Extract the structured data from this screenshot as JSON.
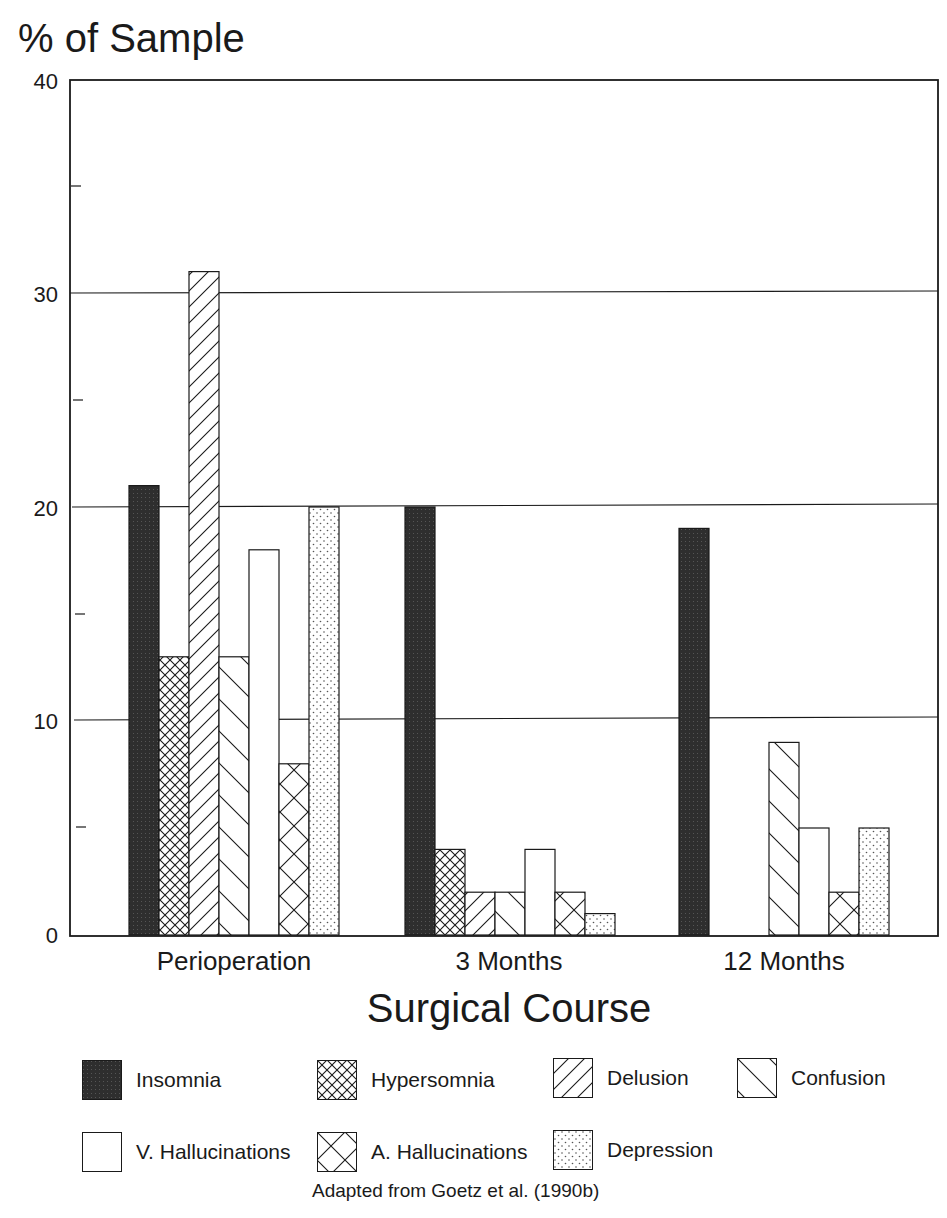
{
  "chart_data": {
    "type": "bar",
    "title": "",
    "ylabel": "% of Sample",
    "xlabel": "Surgical Course",
    "ylim": [
      0,
      40
    ],
    "yticks": [
      0,
      10,
      20,
      30,
      40
    ],
    "minor_yticks": [
      5,
      15,
      25,
      35
    ],
    "grid": true,
    "categories": [
      "Perioperation",
      "3 Months",
      "12 Months"
    ],
    "series": [
      {
        "name": "Insomnia",
        "pattern": "dark",
        "values": [
          21,
          20,
          19
        ]
      },
      {
        "name": "Hypersomnia",
        "pattern": "crosshatch",
        "values": [
          13,
          4,
          0
        ]
      },
      {
        "name": "Delusion",
        "pattern": "forward-diagonal",
        "values": [
          31,
          2,
          0
        ]
      },
      {
        "name": "Confusion",
        "pattern": "back-diagonal",
        "values": [
          13,
          2,
          9
        ]
      },
      {
        "name": "V. Hallucinations",
        "pattern": "empty",
        "values": [
          18,
          4,
          5
        ]
      },
      {
        "name": "A. Hallucinations",
        "pattern": "wide-crosshatch",
        "values": [
          8,
          2,
          2
        ]
      },
      {
        "name": "Depression",
        "pattern": "dots",
        "values": [
          20,
          1,
          5
        ]
      }
    ],
    "legend_position": "bottom",
    "annotation": "Adapted from Goetz et al. (1990b)"
  },
  "axis": {
    "y_title": "% of Sample",
    "x_title": "Surgical Course",
    "y_tick_labels": [
      "40",
      "30",
      "20",
      "10",
      "0"
    ],
    "categories": [
      "Perioperation",
      "3 Months",
      "12 Months"
    ]
  },
  "legend": {
    "items": [
      {
        "label": "Insomnia"
      },
      {
        "label": "Hypersomnia"
      },
      {
        "label": "Delusion"
      },
      {
        "label": "Confusion"
      },
      {
        "label": "V. Hallucinations"
      },
      {
        "label": "A. Hallucinations"
      },
      {
        "label": "Depression"
      }
    ]
  },
  "caption": "Adapted from Goetz et al. (1990b)",
  "colors": {
    "ink": "#1a1a1a",
    "insomnia_fill": "#2e2e2e",
    "background": "#ffffff"
  }
}
